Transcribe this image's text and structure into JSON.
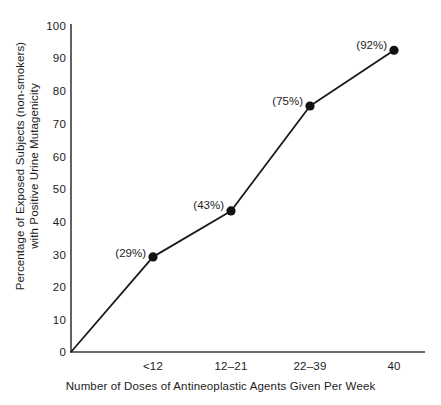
{
  "chart_data": {
    "type": "line",
    "title": "",
    "subtitle": "",
    "xlabel": "Number of Doses of Antineoplastic Agents Given Per Week",
    "ylabel_line1": "Percentage of Exposed Subjects (non-smokers)",
    "ylabel_line2": "with Positive Urine Mutagenicity",
    "categories": [
      "<12",
      "12–21",
      "22–39",
      "40"
    ],
    "values": [
      29,
      43,
      75,
      92
    ],
    "point_labels": [
      "(29%)",
      "(43%)",
      "(75%)",
      "(92%)"
    ],
    "yticks": [
      0,
      10,
      20,
      30,
      40,
      50,
      60,
      70,
      80,
      90,
      100
    ],
    "ytick_labels": [
      "0",
      "10",
      "20",
      "30",
      "40",
      "50",
      "60",
      "70",
      "80",
      "90",
      "100"
    ],
    "ylim": [
      0,
      100
    ],
    "grid": false,
    "legend": false,
    "legend_position": "none",
    "origin_anchored": true,
    "marker": "filled-circle",
    "colors": {
      "line": "#1a1a1a",
      "marker": "#111111",
      "axis": "#3a3a3a",
      "text": "#1c1c1c",
      "background": "#ffffff"
    }
  },
  "geometry": {
    "axis_x": 71,
    "axis_y_top": 24,
    "axis_y_zero": 352,
    "axis_x_right": 425,
    "px_per_unit": 3.28,
    "point_x": [
      153,
      231,
      310,
      394
    ],
    "point_y": [
      257.9,
      210.0,
      106.0,
      50.2
    ]
  }
}
